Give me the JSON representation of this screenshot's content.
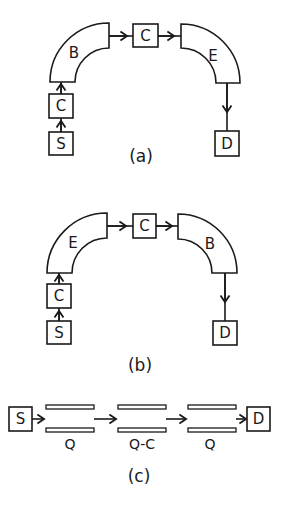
{
  "figure": {
    "panel_a": {
      "caption": "(a)",
      "source_label": "S",
      "lower_corrector_label": "C",
      "first_bend_label": "B",
      "mid_corrector_label": "C",
      "second_bend_label": "E",
      "detector_label": "D"
    },
    "panel_b": {
      "caption": "(b)",
      "source_label": "S",
      "lower_corrector_label": "C",
      "first_bend_label": "E",
      "mid_corrector_label": "C",
      "second_bend_label": "B",
      "detector_label": "D"
    },
    "panel_c": {
      "caption": "(c)",
      "source_label": "S",
      "detector_label": "D",
      "lenses": [
        {
          "label": "Q"
        },
        {
          "label": "Q-C"
        },
        {
          "label": "Q"
        }
      ]
    }
  },
  "colors": {
    "line": "#1a1a1a",
    "background": "#ffffff"
  }
}
